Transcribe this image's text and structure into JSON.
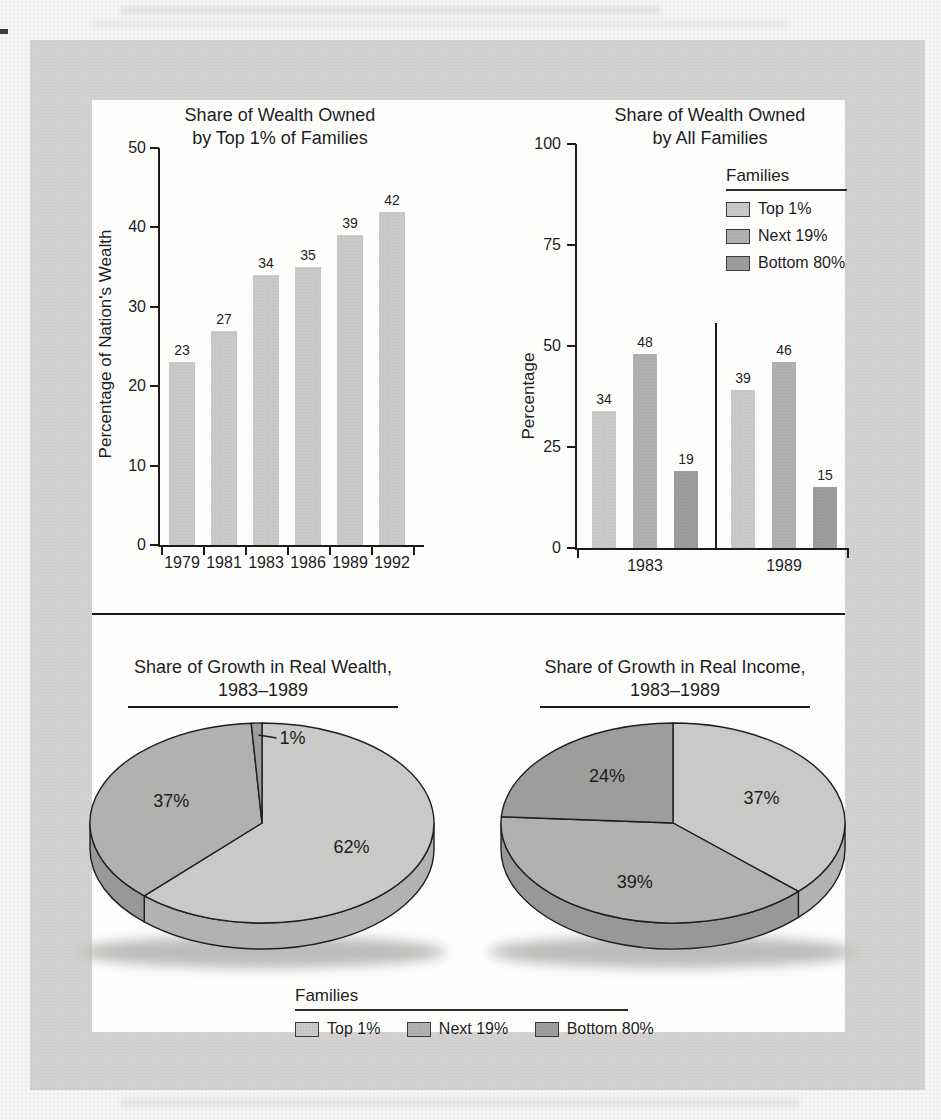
{
  "colors": {
    "top1": {
      "face": "#c9c9c7",
      "side": "#b2b2b0"
    },
    "next19": {
      "face": "#b1b1af",
      "side": "#989896"
    },
    "bottom80": {
      "face": "#9d9d9b",
      "side": "#848482"
    },
    "axis": "#1c1c1c",
    "panel_bg": "#d3d2d0",
    "page_bg": "#f6f5f3",
    "box_bg": "#fdfdfc"
  },
  "chart_data": [
    {
      "id": "wealth_top1",
      "type": "bar",
      "title_line1": "Share of Wealth Owned",
      "title_line2": "by Top 1% of Families",
      "ylabel": "Percentage of Nation's Wealth",
      "categories": [
        "1979",
        "1981",
        "1983",
        "1986",
        "1989",
        "1992"
      ],
      "values": [
        23,
        27,
        34,
        35,
        39,
        42
      ],
      "series_key": "top1",
      "ylim": [
        0,
        50
      ],
      "yticks": [
        0,
        10,
        20,
        30,
        40,
        50
      ],
      "grid": false
    },
    {
      "id": "wealth_all",
      "type": "grouped-bar",
      "title_line1": "Share of Wealth Owned",
      "title_line2": "by All Families",
      "ylabel": "Percentage",
      "categories": [
        "1983",
        "1989"
      ],
      "series": [
        {
          "key": "top1",
          "name": "Top 1%",
          "values": [
            34,
            39
          ]
        },
        {
          "key": "next19",
          "name": "Next 19%",
          "values": [
            48,
            46
          ]
        },
        {
          "key": "bottom80",
          "name": "Bottom 80%",
          "values": [
            19,
            15
          ]
        }
      ],
      "ylim": [
        0,
        100
      ],
      "yticks": [
        0,
        25,
        50,
        75,
        100
      ],
      "grid": false,
      "legend": {
        "title": "Families",
        "position": "upper-right",
        "items": [
          {
            "key": "top1",
            "label": "Top 1%"
          },
          {
            "key": "next19",
            "label": "Next 19%"
          },
          {
            "key": "bottom80",
            "label": "Bottom 80%"
          }
        ]
      }
    },
    {
      "id": "growth_wealth",
      "type": "pie",
      "title_line1": "Share of Growth in Real Wealth,",
      "title_line2": "1983–1989",
      "slices": [
        {
          "key": "top1",
          "label": "Top 1%",
          "value": 62
        },
        {
          "key": "next19",
          "label": "Next 19%",
          "value": 37
        },
        {
          "key": "bottom80",
          "label": "Bottom 80%",
          "value": 1
        }
      ]
    },
    {
      "id": "growth_income",
      "type": "pie",
      "title_line1": "Share of Growth in Real Income,",
      "title_line2": "1983–1989",
      "slices": [
        {
          "key": "top1",
          "label": "Top 1%",
          "value": 37
        },
        {
          "key": "next19",
          "label": "Next 19%",
          "value": 39
        },
        {
          "key": "bottom80",
          "label": "Bottom 80%",
          "value": 24
        }
      ]
    }
  ],
  "legend_bottom": {
    "title": "Families",
    "items": [
      {
        "key": "top1",
        "label": "Top 1%"
      },
      {
        "key": "next19",
        "label": "Next 19%"
      },
      {
        "key": "bottom80",
        "label": "Bottom 80%"
      }
    ]
  }
}
